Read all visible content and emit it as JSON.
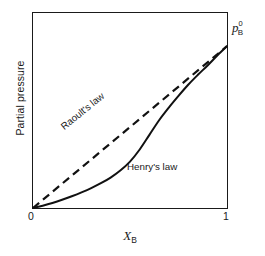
{
  "chart_data": {
    "type": "line",
    "title": "",
    "xlabel": "X_B",
    "xlabel_symbol": "X",
    "xlabel_subscript": "B",
    "ylabel": "Partial pressure",
    "xlim": [
      0,
      1
    ],
    "ylim": [
      0,
      1
    ],
    "x_tick_labels": [
      "0",
      "1"
    ],
    "y_tick_labels": [],
    "grid": false,
    "legend_position": "inline-annotations",
    "series": [
      {
        "name": "Raoult's law",
        "style": "dashed",
        "color": "#111111",
        "annotation": "Raoult's law",
        "x": [
          0.0,
          0.1,
          0.2,
          0.3,
          0.4,
          0.5,
          0.6,
          0.7,
          0.8,
          0.9,
          1.0
        ],
        "values": [
          0.0,
          0.083,
          0.166,
          0.249,
          0.332,
          0.415,
          0.498,
          0.581,
          0.664,
          0.747,
          0.83
        ]
      },
      {
        "name": "Henry's law",
        "style": "solid",
        "color": "#111111",
        "annotation": "Henry's law",
        "x": [
          0.0,
          0.05,
          0.1,
          0.15,
          0.2,
          0.25,
          0.3,
          0.35,
          0.4,
          0.45,
          0.5,
          0.55,
          0.6,
          0.65,
          0.7,
          0.75,
          0.8,
          0.85,
          0.9,
          0.95,
          1.0
        ],
        "values": [
          0.0,
          0.012,
          0.026,
          0.042,
          0.06,
          0.08,
          0.102,
          0.127,
          0.156,
          0.192,
          0.238,
          0.3,
          0.375,
          0.45,
          0.515,
          0.575,
          0.632,
          0.683,
          0.731,
          0.782,
          0.83
        ]
      }
    ],
    "annotations": [
      {
        "name": "p0B",
        "text": "p0B",
        "symbol": "p",
        "superscript": "0",
        "subscript": "B",
        "x": 1.0,
        "y": 0.86
      }
    ],
    "colors": {
      "ink": "#1a1a1a",
      "curve": "#111111",
      "background": "#ffffff",
      "frame": "#1a1a1a"
    }
  }
}
